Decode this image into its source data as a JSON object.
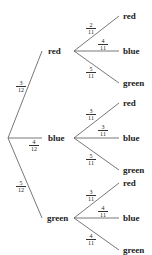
{
  "tree": {
    "first_level": [
      {
        "outcome": "red",
        "probability": {
          "num": "3",
          "den": "12"
        }
      },
      {
        "outcome": "blue",
        "probability": {
          "num": "4",
          "den": "12"
        }
      },
      {
        "outcome": "green",
        "probability": {
          "num": "5",
          "den": "12"
        }
      }
    ],
    "second_level": {
      "red": [
        {
          "outcome": "red",
          "probability": {
            "num": "2",
            "den": "11"
          }
        },
        {
          "outcome": "blue",
          "probability": {
            "num": "4",
            "den": "11"
          }
        },
        {
          "outcome": "green",
          "probability": {
            "num": "5",
            "den": "11"
          }
        }
      ],
      "blue": [
        {
          "outcome": "red",
          "probability": {
            "num": "3",
            "den": "11"
          }
        },
        {
          "outcome": "blue",
          "probability": {
            "num": "3",
            "den": "11"
          }
        },
        {
          "outcome": "green",
          "probability": {
            "num": "5",
            "den": "11"
          }
        }
      ],
      "green": [
        {
          "outcome": "red",
          "probability": {
            "num": "3",
            "den": "11"
          }
        },
        {
          "outcome": "blue",
          "probability": {
            "num": "4",
            "den": "11"
          }
        },
        {
          "outcome": "green",
          "probability": {
            "num": "4",
            "den": "11"
          }
        }
      ]
    }
  },
  "colors": {
    "line": "#555555",
    "text": "#222222"
  }
}
